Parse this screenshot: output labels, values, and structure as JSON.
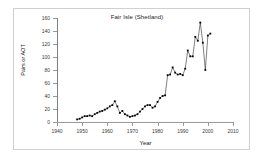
{
  "figure": {
    "title": "Fair Isle (Shetland)",
    "xlabel": "Year",
    "ylabel": "Pairs or AOT"
  },
  "axes": {
    "y_ticks": [
      0,
      20,
      40,
      60,
      80,
      100,
      120,
      140,
      160
    ],
    "x_ticks": [
      1940,
      1950,
      1960,
      1970,
      1980,
      1990,
      2000,
      2010
    ],
    "colors": {
      "axis": "#9a9a9a",
      "marker": "#000000",
      "line": "#000000",
      "frame": "#d0d0d0",
      "background": "#ffffff"
    }
  },
  "chart_data": {
    "type": "line",
    "title": "Fair Isle (Shetland)",
    "xlabel": "Year",
    "ylabel": "Pairs or AOT",
    "xlim": [
      1940,
      2010
    ],
    "ylim": [
      0,
      160
    ],
    "grid": false,
    "legend": null,
    "marker": "filled-square",
    "x": [
      1948,
      1949,
      1950,
      1951,
      1952,
      1953,
      1954,
      1955,
      1956,
      1957,
      1958,
      1959,
      1960,
      1961,
      1962,
      1963,
      1964,
      1965,
      1966,
      1967,
      1968,
      1969,
      1970,
      1971,
      1972,
      1973,
      1974,
      1975,
      1976,
      1977,
      1978,
      1979,
      1980,
      1981,
      1982,
      1983,
      1984,
      1985,
      1986,
      1987,
      1988,
      1989,
      1990,
      1991,
      1992,
      1993,
      1994,
      1995,
      1996,
      1997,
      1998,
      1999,
      2000,
      2001
    ],
    "values": [
      4,
      5,
      7,
      9,
      9,
      10,
      9,
      12,
      14,
      16,
      17,
      19,
      21,
      24,
      26,
      32,
      24,
      14,
      17,
      12,
      10,
      8,
      9,
      10,
      12,
      16,
      20,
      24,
      26,
      26,
      22,
      24,
      31,
      37,
      40,
      41,
      72,
      73,
      84,
      76,
      73,
      74,
      72,
      82,
      110,
      101,
      101,
      131,
      125,
      153,
      122,
      80,
      133,
      136
    ],
    "series": [
      {
        "name": "Fair Isle (Shetland)",
        "values": [
          4,
          5,
          7,
          9,
          9,
          10,
          9,
          12,
          14,
          16,
          17,
          19,
          21,
          24,
          26,
          32,
          24,
          14,
          17,
          12,
          10,
          8,
          9,
          10,
          12,
          16,
          20,
          24,
          26,
          26,
          22,
          24,
          31,
          37,
          40,
          41,
          72,
          73,
          84,
          76,
          73,
          74,
          72,
          82,
          110,
          101,
          101,
          131,
          125,
          153,
          122,
          80,
          133,
          136
        ]
      }
    ]
  }
}
